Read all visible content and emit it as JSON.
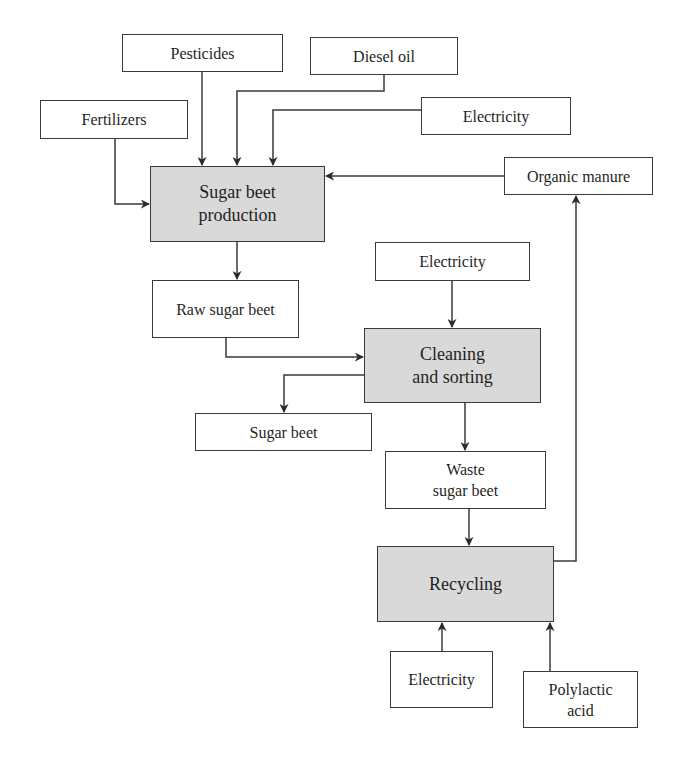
{
  "diagram": {
    "type": "flowchart",
    "colors": {
      "process_fill": "#d9d9d9",
      "box_fill": "#ffffff",
      "stroke": "#3a3a3a",
      "text": "#1f1f1f"
    },
    "nodes": {
      "pesticides": {
        "label": "Pesticides",
        "kind": "input"
      },
      "diesel_oil": {
        "label": "Diesel oil",
        "kind": "input"
      },
      "fertilizers": {
        "label": "Fertilizers",
        "kind": "input"
      },
      "electricity_1": {
        "label": "Electricity",
        "kind": "input"
      },
      "organic_manure": {
        "label": "Organic manure",
        "kind": "output"
      },
      "sugar_beet_production": {
        "label": "Sugar beet\nproduction",
        "kind": "process"
      },
      "raw_sugar_beet": {
        "label": "Raw sugar beet",
        "kind": "intermediate"
      },
      "electricity_2": {
        "label": "Electricity",
        "kind": "input"
      },
      "cleaning_and_sorting": {
        "label": "Cleaning\nand sorting",
        "kind": "process"
      },
      "sugar_beet": {
        "label": "Sugar beet",
        "kind": "output"
      },
      "waste_sugar_beet": {
        "label": "Waste\nsugar beet",
        "kind": "intermediate"
      },
      "recycling": {
        "label": "Recycling",
        "kind": "process"
      },
      "electricity_3": {
        "label": "Electricity",
        "kind": "input"
      },
      "polylactic_acid": {
        "label": "Polylactic\nacid",
        "kind": "output"
      }
    },
    "edges": [
      {
        "from": "pesticides",
        "to": "sugar_beet_production"
      },
      {
        "from": "diesel_oil",
        "to": "sugar_beet_production"
      },
      {
        "from": "electricity_1",
        "to": "sugar_beet_production"
      },
      {
        "from": "fertilizers",
        "to": "sugar_beet_production"
      },
      {
        "from": "organic_manure",
        "to": "sugar_beet_production"
      },
      {
        "from": "sugar_beet_production",
        "to": "raw_sugar_beet"
      },
      {
        "from": "raw_sugar_beet",
        "to": "cleaning_and_sorting"
      },
      {
        "from": "electricity_2",
        "to": "cleaning_and_sorting"
      },
      {
        "from": "cleaning_and_sorting",
        "to": "sugar_beet"
      },
      {
        "from": "cleaning_and_sorting",
        "to": "waste_sugar_beet"
      },
      {
        "from": "waste_sugar_beet",
        "to": "recycling"
      },
      {
        "from": "electricity_3",
        "to": "recycling"
      },
      {
        "from": "polylactic_acid",
        "to": "recycling"
      },
      {
        "from": "recycling",
        "to": "organic_manure"
      }
    ]
  }
}
